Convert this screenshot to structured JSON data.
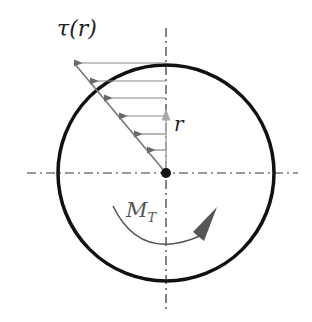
{
  "diagram": {
    "type": "torsion shear stress distribution in circular shaft cross-section",
    "labels": {
      "shear_stress": "τ(r)",
      "radius": "r",
      "torque_main": "M",
      "torque_sub": "T"
    },
    "colors": {
      "circle": "#111111",
      "axis": "#222222",
      "arrows": "#666666",
      "radius_arrow": "#aaaaaa",
      "moment_arrow": "#555555"
    }
  }
}
